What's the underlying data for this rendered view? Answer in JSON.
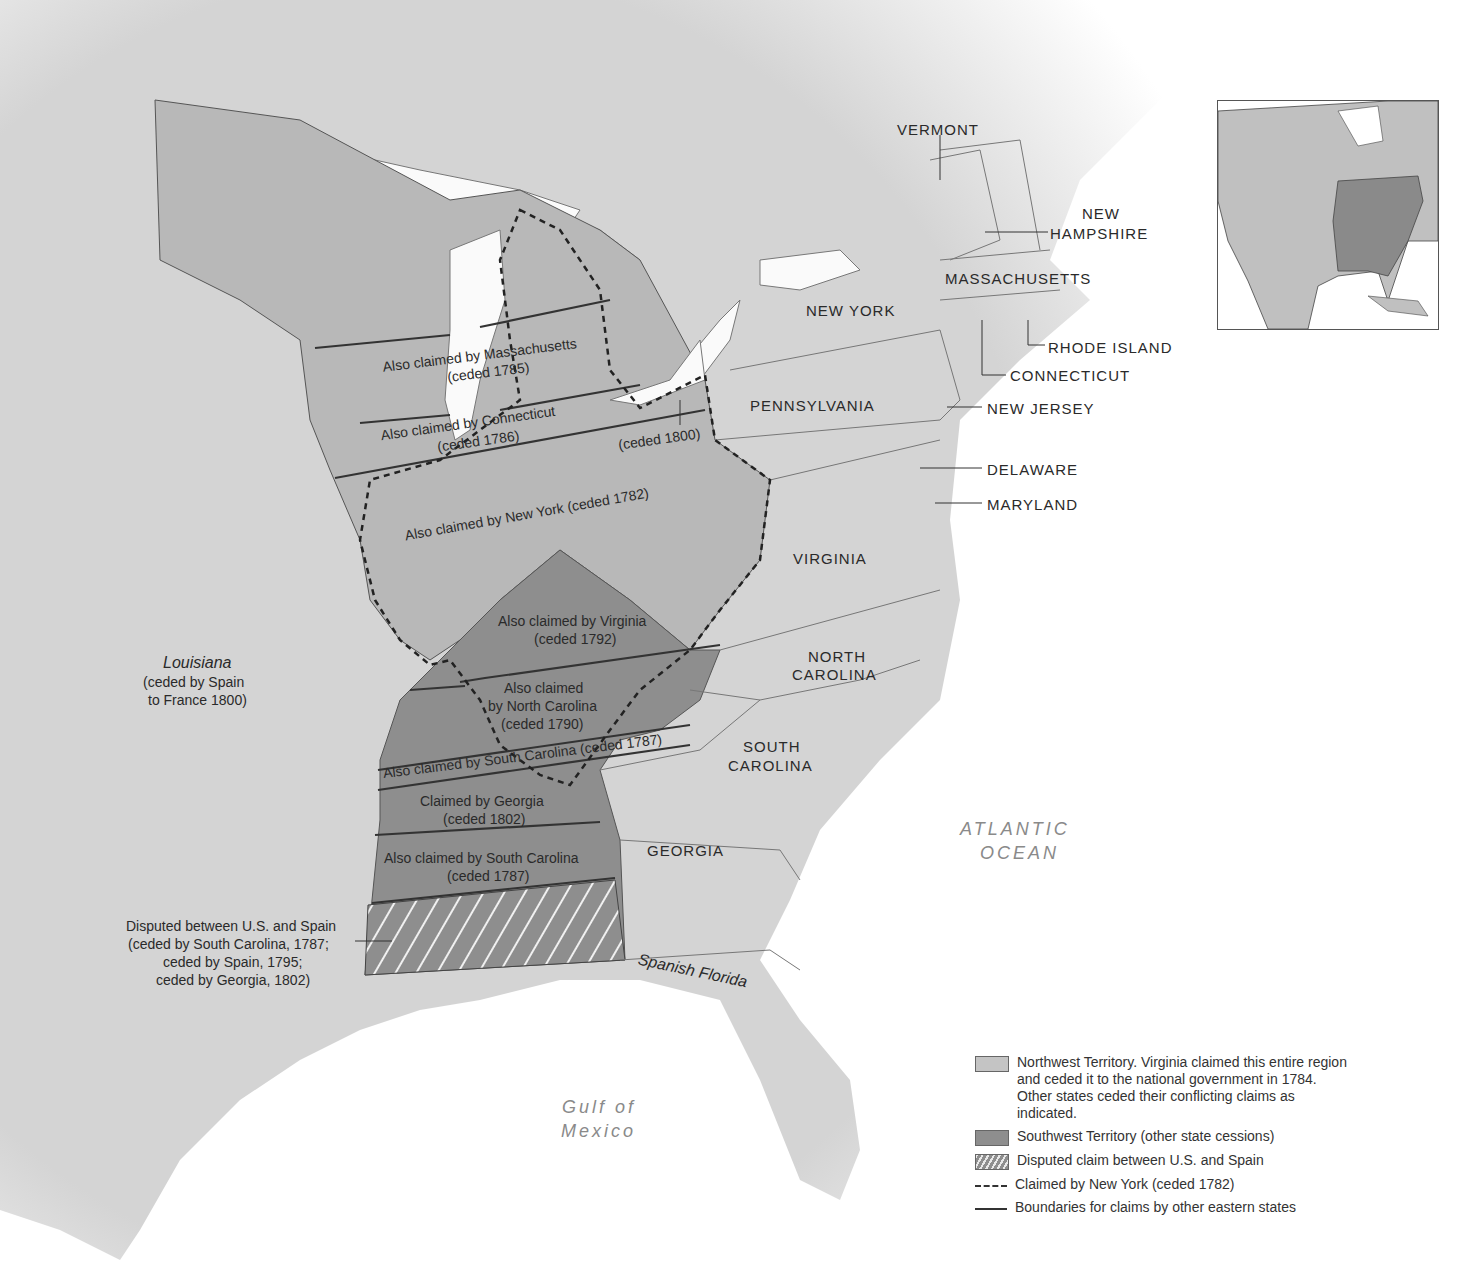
{
  "map": {
    "title_visible": false,
    "states": {
      "vermont": "VERMONT",
      "new_hampshire_1": "NEW",
      "new_hampshire_2": "HAMPSHIRE",
      "massachusetts": "MASSACHUSETTS",
      "new_york": "NEW YORK",
      "rhode_island": "RHODE ISLAND",
      "connecticut": "CONNECTICUT",
      "pennsylvania": "PENNSYLVANIA",
      "new_jersey": "NEW JERSEY",
      "delaware": "DELAWARE",
      "maryland": "MARYLAND",
      "virginia": "VIRGINIA",
      "north_carolina_1": "NORTH",
      "north_carolina_2": "CAROLINA",
      "south_carolina_1": "SOUTH",
      "south_carolina_2": "CAROLINA",
      "georgia": "GEORGIA"
    },
    "regions": {
      "louisiana_name": "Louisiana",
      "louisiana_note_1": "(ceded by Spain",
      "louisiana_note_2": "to France 1800)",
      "spanish_florida": "Spanish Florida",
      "atlantic_1": "ATLANTIC",
      "atlantic_2": "OCEAN",
      "gulf_1": "Gulf of",
      "gulf_2": "Mexico"
    },
    "claims": {
      "massachusetts_1": "Also claimed by Massachusetts",
      "massachusetts_2": "(ceded 1785)",
      "connecticut_1": "Also claimed by Connecticut",
      "connecticut_2": "(ceded 1786)",
      "connecticut_reserve": "(ceded 1800)",
      "new_york": "Also claimed by New York (ceded 1782)",
      "virginia_1": "Also claimed by Virginia",
      "virginia_2": "(ceded 1792)",
      "north_carolina_1": "Also claimed",
      "north_carolina_2": "by North Carolina",
      "north_carolina_3": "(ceded 1790)",
      "south_carolina_strip": "Also claimed by South Carolina (ceded 1787)",
      "georgia_1": "Claimed by Georgia",
      "georgia_2": "(ceded 1802)",
      "south_carolina_2_1": "Also claimed by South Carolina",
      "south_carolina_2_2": "(ceded 1787)",
      "disputed_1": "Disputed between U.S. and Spain",
      "disputed_2": "(ceded by South Carolina, 1787;",
      "disputed_3": "ceded by Spain, 1795;",
      "disputed_4": "ceded by Georgia, 1802)"
    }
  },
  "legend": {
    "items": [
      {
        "icon": "northwest-territory-swatch",
        "label": "Northwest Territory. Virginia claimed this entire region and ceded it to the national government in 1784. Other states ceded their conflicting claims as indicated."
      },
      {
        "icon": "southwest-territory-swatch",
        "label": "Southwest Territory (other state cessions)"
      },
      {
        "icon": "disputed-hatch-swatch",
        "label": "Disputed claim between U.S. and Spain"
      },
      {
        "icon": "dashed-line",
        "label": "Claimed by New York (ceded 1782)"
      },
      {
        "icon": "solid-line",
        "label": "Boundaries for claims by other eastern states"
      }
    ]
  },
  "colors": {
    "land": "#d6d6d6",
    "northwest": "#b8b8b8",
    "southwest": "#8e8e8e",
    "water": "#ffffff",
    "line": "#333333"
  }
}
